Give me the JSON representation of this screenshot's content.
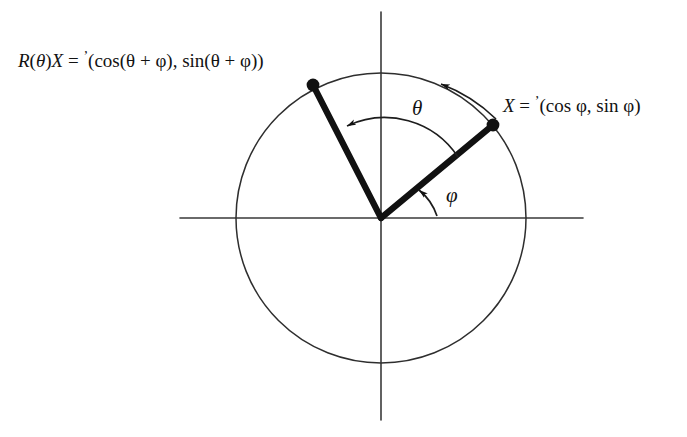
{
  "figure": {
    "type": "unit-circle-rotation-diagram",
    "background_color": "#ffffff",
    "stroke_color": "#121212",
    "geometry": {
      "origin": [
        381,
        218
      ],
      "circle_radius": 145,
      "x_axis": [
        180,
        218,
        583,
        218
      ],
      "y_axis": [
        381,
        12,
        381,
        420
      ],
      "point_X": [
        493,
        125
      ],
      "point_RX": [
        313,
        85
      ],
      "angle_phi_degrees": 37,
      "angle_theta_degrees": 86
    },
    "labels": {
      "rotated_vector": {
        "lhs_R": "R",
        "lhs_paren_open": "(",
        "lhs_theta": "θ",
        "lhs_paren_close": ")",
        "lhs_X": "X",
        "equals": "=",
        "prime": "ʼ",
        "rhs": "(cos(θ + φ), sin(θ + φ))",
        "full_text": "R(θ)X = ʼ(cos(θ + φ), sin(θ + φ))"
      },
      "base_vector": {
        "lhs_X": "X",
        "equals": "=",
        "prime": "ʼ",
        "rhs": "(cos φ, sin φ)",
        "full_text": "X = ʼ(cos φ, sin φ)"
      },
      "angle_theta": "θ",
      "angle_phi": "φ"
    }
  }
}
